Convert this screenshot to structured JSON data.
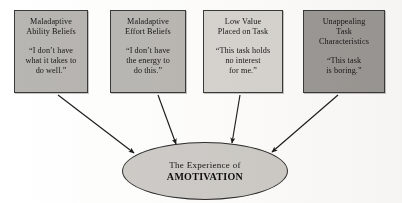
{
  "diagram": {
    "type": "flow-diagram",
    "title_text_visible": false,
    "background_color": "#ffffff",
    "width": 402,
    "height": 203,
    "boxes": [
      {
        "id": "maladaptive-ability-beliefs",
        "title": "Maladaptive\nAbility Beliefs",
        "quote": "“I don’t have\nwhat it takes to\ndo well.”",
        "fill": "#b8b6b2",
        "border": "#3a3a3a",
        "x": 14,
        "y": 10,
        "width": 74,
        "height": 83
      },
      {
        "id": "maladaptive-effort-beliefs",
        "title": "Maladaptive\nEffort Beliefs",
        "quote": "“I don’t have\nthe energy to\ndo this.”",
        "fill": "#bab8b4",
        "border": "#3a3a3a",
        "x": 110,
        "y": 10,
        "width": 76,
        "height": 83
      },
      {
        "id": "low-value-placed-on-task",
        "title": "Low Value\nPlaced on Task",
        "quote": "“This task holds\nno interest\nfor me.”",
        "fill": "#d8d6d2",
        "border": "#3a3a3a",
        "x": 203,
        "y": 10,
        "width": 80,
        "height": 83
      },
      {
        "id": "unappealing-task-characteristics",
        "title": "Unappealing\nTask\nCharacteristics",
        "quote": "“This task\nis boring.”",
        "fill": "#9d9b98",
        "border": "#3a3a3a",
        "x": 303,
        "y": 10,
        "width": 82,
        "height": 83
      }
    ],
    "ellipse": {
      "id": "experience-of-amotivation",
      "line1": "The Experience of",
      "line2": "AMOTIVATION",
      "fill": "#cfcdc9",
      "border": "#2e2e2e",
      "x": 122,
      "y": 142,
      "width": 166,
      "height": 58
    },
    "arrows": [
      {
        "id": "arrow-ability-to-amotivation",
        "x1": 58,
        "y1": 95,
        "x2": 134,
        "y2": 153,
        "color": "#1c1c1c"
      },
      {
        "id": "arrow-effort-to-amotivation",
        "x1": 158,
        "y1": 95,
        "x2": 176,
        "y2": 144,
        "color": "#1c1c1c"
      },
      {
        "id": "arrow-value-to-amotivation",
        "x1": 240,
        "y1": 95,
        "x2": 232,
        "y2": 143,
        "color": "#1c1c1c"
      },
      {
        "id": "arrow-task-to-amotivation",
        "x1": 338,
        "y1": 95,
        "x2": 272,
        "y2": 152,
        "color": "#1c1c1c"
      }
    ]
  }
}
